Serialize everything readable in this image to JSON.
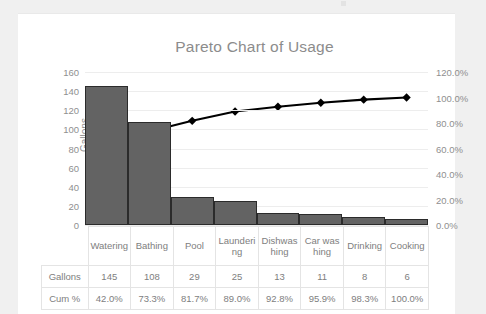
{
  "chart_data": {
    "type": "bar",
    "title": "Pareto Chart of Usage",
    "categories": [
      "Watering",
      "Bathing",
      "Pool",
      "Laundering",
      "Dishwashing",
      "Car washing",
      "Drinking",
      "Cooking"
    ],
    "series": [
      {
        "name": "Gallons",
        "type": "bar",
        "axis": "left",
        "values": [
          145,
          108,
          29,
          25,
          13,
          11,
          8,
          6
        ]
      },
      {
        "name": "Cum %",
        "type": "line",
        "axis": "right",
        "values": [
          42.0,
          73.3,
          81.7,
          89.0,
          92.8,
          95.9,
          98.3,
          100.0
        ]
      }
    ],
    "xlabel": "",
    "ylabel": "Gallons",
    "ylim": [
      0,
      160
    ],
    "yticks": [
      "0",
      "20",
      "40",
      "60",
      "80",
      "100",
      "120",
      "140",
      "160"
    ],
    "y2label": "",
    "y2lim": [
      0,
      120
    ],
    "y2ticks": [
      "0.0%",
      "20.0%",
      "40.0%",
      "60.0%",
      "80.0%",
      "100.0%",
      "120.0%"
    ],
    "grid": true,
    "legend": "none",
    "bar_color": "#636363",
    "bar_border_color": "#2b2b2b",
    "line_color": "#000000",
    "marker": "diamond",
    "title_color": "#8c8c8c"
  },
  "table": {
    "row_headers": [
      "Gallons",
      "Cum %"
    ],
    "categories": [
      "Watering",
      "Bathing",
      "Pool",
      "Laundering",
      "Dishwashing",
      "Car washing",
      "Drinking",
      "Cooking"
    ],
    "gallons": [
      "145",
      "108",
      "29",
      "25",
      "13",
      "11",
      "8",
      "6"
    ],
    "cum_pct": [
      "42.0%",
      "73.3%",
      "81.7%",
      "89.0%",
      "92.8%",
      "95.9%",
      "98.3%",
      "100.0%"
    ]
  }
}
